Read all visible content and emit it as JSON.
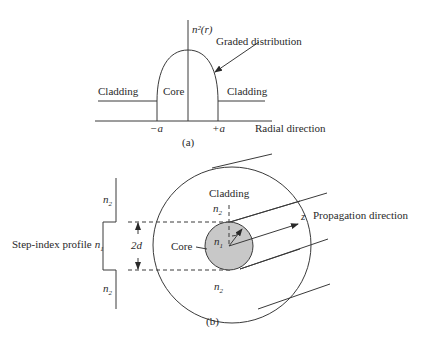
{
  "figure_a": {
    "y_axis_label": "n²(r)",
    "curve_label": "Graded distribution",
    "left_region": "Cladding",
    "center_region": "Core",
    "right_region": "Cladding",
    "tick_left": "−a",
    "tick_right": "+a",
    "x_axis_label": "Radial direction",
    "caption": "(a)"
  },
  "figure_b": {
    "profile_label": "Step-index profile",
    "profile_n1": "n",
    "profile_n1_sub": "1",
    "profile_n2_top": "n",
    "profile_n2_top_sub": "2",
    "profile_n2_bottom": "n",
    "profile_n2_bottom_sub": "2",
    "diameter_label": "2d",
    "cladding_label": "Cladding",
    "cladding_n2_top": "n",
    "cladding_n2_top_sub": "2",
    "cladding_n2_bottom": "n",
    "cladding_n2_bottom_sub": "2",
    "core_label": "Core",
    "core_n1": "n",
    "core_n1_sub": "1",
    "axis_label": "z",
    "direction_label": "Propagation direction",
    "caption": "(b)",
    "core_fill": "#c8c8c8"
  }
}
